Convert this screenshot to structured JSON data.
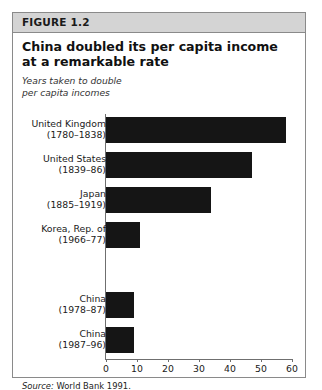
{
  "figure": {
    "number_label": "FIGURE 1.2",
    "title": "China doubled its per capita income at a remarkable rate",
    "subtitle_line1": "Years taken to double",
    "subtitle_line2": "per capita incomes",
    "source_prefix": "Source:",
    "source_text": "World Bank 1991."
  },
  "colors": {
    "bar": "#151515",
    "header_band": "#d4d4d4",
    "border": "#8a8a8a",
    "axis": "#6f6f6f"
  },
  "chart_data": {
    "type": "bar",
    "orientation": "horizontal",
    "title": "China doubled its per capita income at a remarkable rate",
    "subtitle": "Years taken to double per capita incomes",
    "xlabel": "",
    "ylabel": "",
    "xlim": [
      0,
      60
    ],
    "xticks": [
      0,
      10,
      20,
      30,
      40,
      50,
      60
    ],
    "xtick_labels": [
      "0",
      "10",
      "20",
      "30",
      "40",
      "50",
      "60"
    ],
    "grid": false,
    "legend": null,
    "categories": [
      "United Kingdom (1780-1838)",
      "United States (1839-86)",
      "Japan (1885-1919)",
      "Korea, Rep. of (1966-77)",
      "China (1978-87)",
      "China (1987-96)"
    ],
    "values": [
      58,
      47,
      34,
      11,
      9,
      9
    ],
    "bars": [
      {
        "country": "United Kingdom",
        "period": "(1780–1838)",
        "value": 58,
        "slot": 0
      },
      {
        "country": "United States",
        "period": "(1839–86)",
        "value": 47,
        "slot": 1
      },
      {
        "country": "Japan",
        "period": "(1885–1919)",
        "value": 34,
        "slot": 2
      },
      {
        "country": "Korea, Rep. of",
        "period": "(1966–77)",
        "value": 11,
        "slot": 3
      },
      {
        "country": "China",
        "period": "(1978–87)",
        "value": 9,
        "slot": 5
      },
      {
        "country": "China",
        "period": "(1987–96)",
        "value": 9,
        "slot": 6
      }
    ],
    "source": "Source: World Bank 1991."
  }
}
